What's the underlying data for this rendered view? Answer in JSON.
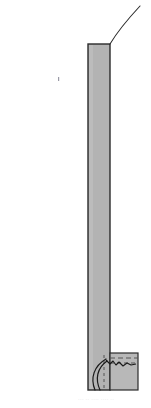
{
  "figure": {
    "type": "structural-section-drawing",
    "canvas": {
      "width": 151,
      "height": 408
    },
    "background_color": "#ffffff"
  },
  "colors": {
    "concrete_fill": "#b3b3b3",
    "base_fill": "#b8b8b8",
    "outline": "#2b2b2b",
    "dashed_line": "#555555",
    "tendon": "#1a1a1a",
    "speck": "#9a9aa6",
    "ghost_text": "#d8d8d8"
  },
  "column": {
    "label": "column-shaft",
    "x_left": 88,
    "x_right": 110,
    "y_top": 44,
    "y_bottom": 390,
    "fill": "#b3b3b3",
    "stroke": "#2b2b2b",
    "stroke_width": 1.4
  },
  "deflection_curve": {
    "label": "deflected-shape-curve",
    "description": "thin curved line rising from column top-right toward upper right corner",
    "start": {
      "x": 110,
      "y": 44
    },
    "control_1": {
      "x": 116,
      "y": 34
    },
    "control_2": {
      "x": 127,
      "y": 20
    },
    "end": {
      "x": 140,
      "y": 6
    },
    "stroke": "#2b2b2b",
    "stroke_width": 1.1
  },
  "foundation_block": {
    "label": "foundation-base-block",
    "x_left": 110,
    "x_right": 138,
    "y_top": 353,
    "y_bottom": 390,
    "fill": "#b8b8b8",
    "stroke": "#2b2b2b",
    "stroke_width": 1.2
  },
  "dashed_lines": [
    {
      "name": "construction-joint-line-upper",
      "x1": 110,
      "y1": 358,
      "x2": 138,
      "y2": 358
    },
    {
      "name": "construction-joint-line-lower",
      "x1": 110,
      "y1": 363,
      "x2": 137,
      "y2": 363
    },
    {
      "name": "vertical-tendon-duct-line",
      "x1": 104,
      "y1": 355,
      "x2": 104,
      "y2": 388
    }
  ],
  "tendons": [
    {
      "name": "tendon-hook-outer",
      "description": "curved prestressing tendon hooking down and left inside column base",
      "start": {
        "x": 106,
        "y": 359
      },
      "control_1": {
        "x": 94,
        "y": 366
      },
      "control_2": {
        "x": 90,
        "y": 378
      },
      "end": {
        "x": 95,
        "y": 390
      }
    },
    {
      "name": "tendon-hook-inner",
      "description": "second curved prestressing tendon parallel to the outer hook",
      "start": {
        "x": 107,
        "y": 361
      },
      "control_1": {
        "x": 97,
        "y": 368
      },
      "control_2": {
        "x": 95,
        "y": 379
      },
      "end": {
        "x": 100,
        "y": 390
      }
    }
  ],
  "zigzag": {
    "name": "anchorage-zigzag-line",
    "description": "irregular zigzag line running right from the tendon heads across the base block",
    "points": "106,360 110,364 113,361 116,365 119,362 123,366 127,363 131,365 136,364"
  },
  "speck": {
    "name": "scan-speck-artifact",
    "x": 58,
    "y": 77,
    "width": 1.2,
    "height": 4
  },
  "ghost_caption": {
    "name": "ghost-caption-artifact",
    "text": "··· ·· ···· ···· ··"
  }
}
